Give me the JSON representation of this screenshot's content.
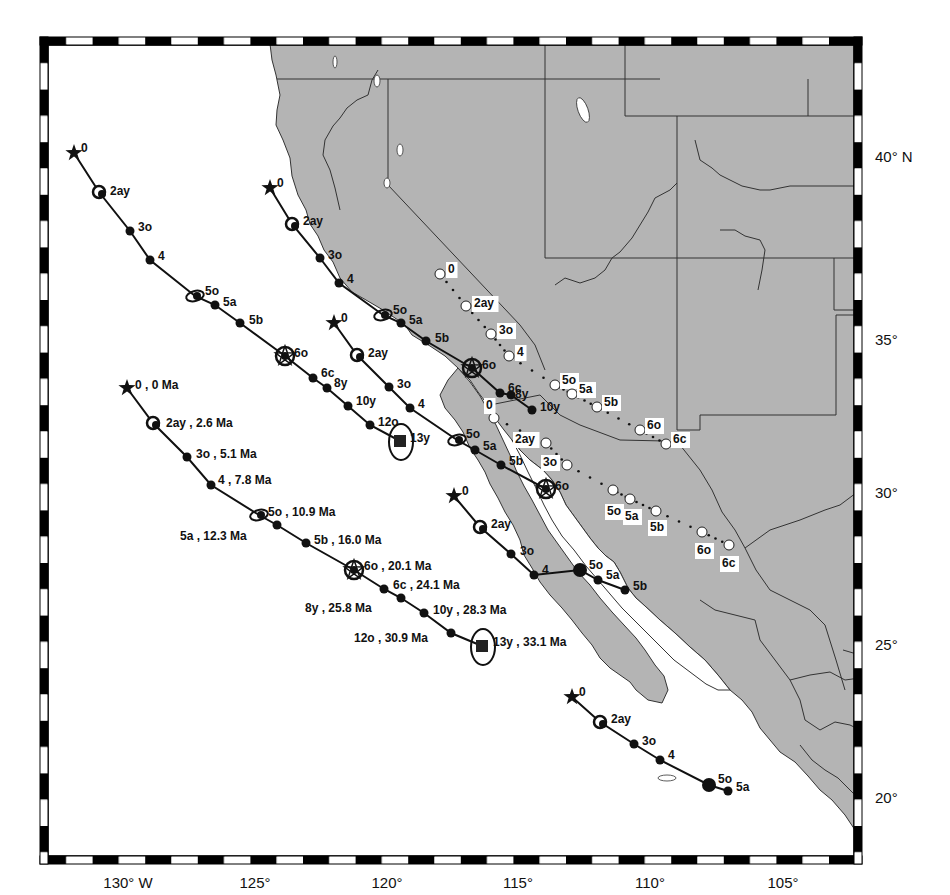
{
  "map": {
    "colors": {
      "land": "#b4b4b4",
      "ocean": "#ffffff",
      "border": "#333333",
      "frame": "#000000",
      "track": "#111111"
    },
    "lon_labels": [
      {
        "text": "130° W",
        "x": 128
      },
      {
        "text": "125°",
        "x": 255
      },
      {
        "text": "120°",
        "x": 387
      },
      {
        "text": "115°",
        "x": 518
      },
      {
        "text": "110°",
        "x": 650
      },
      {
        "text": "105°",
        "x": 783
      }
    ],
    "lat_labels": [
      {
        "text": "40° N",
        "y": 157
      },
      {
        "text": "35°",
        "y": 340
      },
      {
        "text": "30°",
        "y": 493
      },
      {
        "text": "25°",
        "y": 645
      },
      {
        "text": "20°",
        "y": 798
      }
    ],
    "tracks": [
      {
        "name": "track-far-west-annotated",
        "points": [
          {
            "label": "0 , 0 Ma",
            "x": 127,
            "y": 388,
            "sym": "star",
            "lx": 135,
            "ly": 386
          },
          {
            "label": "2ay , 2.6 Ma",
            "x": 153,
            "y": 423,
            "sym": "ring",
            "lx": 166,
            "ly": 424
          },
          {
            "label": "3o , 5.1 Ma",
            "x": 187,
            "y": 457,
            "sym": "dot",
            "lx": 196,
            "ly": 455
          },
          {
            "label": "4 , 7.8 Ma",
            "x": 211,
            "y": 485,
            "sym": "dot",
            "lx": 218,
            "ly": 481
          },
          {
            "label": "5o , 10.9 Ma",
            "x": 259,
            "y": 515,
            "sym": "ellipse",
            "lx": 268,
            "ly": 513
          },
          {
            "label": "5a , 12.3 Ma",
            "x": 277,
            "y": 525,
            "sym": "dot",
            "lx": 180,
            "ly": 537
          },
          {
            "label": "5b , 16.0 Ma",
            "x": 306,
            "y": 543,
            "sym": "dot",
            "lx": 314,
            "ly": 541
          },
          {
            "label": "6o , 20.1 Ma",
            "x": 354,
            "y": 570,
            "sym": "bigstar",
            "lx": 364,
            "ly": 567
          },
          {
            "label": "6c , 24.1 Ma",
            "x": 384,
            "y": 589,
            "sym": "dot",
            "lx": 393,
            "ly": 586
          },
          {
            "label": "8y , 25.8 Ma",
            "x": 401,
            "y": 598,
            "sym": "dot",
            "lx": 305,
            "ly": 609
          },
          {
            "label": "10y , 28.3 Ma",
            "x": 424,
            "y": 613,
            "sym": "dot",
            "lx": 433,
            "ly": 611
          },
          {
            "label": "12o , 30.9 Ma",
            "x": 451,
            "y": 633,
            "sym": "dot",
            "lx": 354,
            "ly": 639
          },
          {
            "label": "13y , 33.1 Ma",
            "x": 482,
            "y": 646,
            "sym": "square",
            "lx": 493,
            "ly": 643
          }
        ]
      },
      {
        "name": "track-far-west",
        "points": [
          {
            "label": "0",
            "x": 74,
            "y": 153,
            "sym": "star",
            "lx": 81,
            "ly": 149
          },
          {
            "label": "2ay",
            "x": 99,
            "y": 192,
            "sym": "ring",
            "lx": 110,
            "ly": 192
          },
          {
            "label": "3o",
            "x": 130,
            "y": 231,
            "sym": "dot",
            "lx": 138,
            "ly": 228
          },
          {
            "label": "4",
            "x": 150,
            "y": 260,
            "sym": "dot",
            "lx": 158,
            "ly": 257
          },
          {
            "label": "5o",
            "x": 195,
            "y": 296,
            "sym": "ellipse",
            "lx": 205,
            "ly": 292
          },
          {
            "label": "5a",
            "x": 215,
            "y": 305,
            "sym": "dot",
            "lx": 223,
            "ly": 303
          },
          {
            "label": "5b",
            "x": 240,
            "y": 323,
            "sym": "dot",
            "lx": 249,
            "ly": 321
          },
          {
            "label": "6o",
            "x": 285,
            "y": 356,
            "sym": "bigstar",
            "lx": 294,
            "ly": 354
          },
          {
            "label": "6c",
            "x": 313,
            "y": 378,
            "sym": "dot",
            "lx": 321,
            "ly": 374
          },
          {
            "label": "8y",
            "x": 327,
            "y": 388,
            "sym": "dot",
            "lx": 334,
            "ly": 384
          },
          {
            "label": "10y",
            "x": 348,
            "y": 406,
            "sym": "dot",
            "lx": 356,
            "ly": 402
          },
          {
            "label": "12o",
            "x": 370,
            "y": 425,
            "sym": "dot",
            "lx": 378,
            "ly": 423
          },
          {
            "label": "13y",
            "x": 400,
            "y": 441,
            "sym": "square",
            "lx": 410,
            "ly": 439
          }
        ]
      },
      {
        "name": "track-north-coast",
        "points": [
          {
            "label": "0",
            "x": 270,
            "y": 188,
            "sym": "star",
            "lx": 277,
            "ly": 184
          },
          {
            "label": "2ay",
            "x": 292,
            "y": 224,
            "sym": "ring",
            "lx": 303,
            "ly": 222
          },
          {
            "label": "3o",
            "x": 320,
            "y": 258,
            "sym": "dot",
            "lx": 328,
            "ly": 256
          },
          {
            "label": "4",
            "x": 339,
            "y": 283,
            "sym": "dot",
            "lx": 347,
            "ly": 280
          },
          {
            "label": "5o",
            "x": 383,
            "y": 315,
            "sym": "ellipse",
            "lx": 393,
            "ly": 311
          },
          {
            "label": "5a",
            "x": 401,
            "y": 323,
            "sym": "dot",
            "lx": 409,
            "ly": 321
          },
          {
            "label": "5b",
            "x": 426,
            "y": 341,
            "sym": "dot",
            "lx": 435,
            "ly": 339
          },
          {
            "label": "6o",
            "x": 472,
            "y": 368,
            "sym": "bigstar",
            "lx": 482,
            "ly": 366
          },
          {
            "label": "6c",
            "x": 500,
            "y": 393,
            "sym": "dot",
            "lx": 508,
            "ly": 389
          },
          {
            "label": "8y",
            "x": 511,
            "y": 395,
            "sym": "dot",
            "lx": 515,
            "ly": 395
          },
          {
            "label": "10y",
            "x": 532,
            "y": 410,
            "sym": "dot",
            "lx": 540,
            "ly": 408
          }
        ]
      },
      {
        "name": "track-central",
        "points": [
          {
            "label": "0",
            "x": 334,
            "y": 323,
            "sym": "star",
            "lx": 341,
            "ly": 319
          },
          {
            "label": "2ay",
            "x": 357,
            "y": 355,
            "sym": "ring",
            "lx": 368,
            "ly": 354
          },
          {
            "label": "3o",
            "x": 389,
            "y": 387,
            "sym": "dot",
            "lx": 397,
            "ly": 385
          },
          {
            "label": "4",
            "x": 410,
            "y": 408,
            "sym": "dot",
            "lx": 418,
            "ly": 405
          },
          {
            "label": "5o",
            "x": 457,
            "y": 440,
            "sym": "ellipse",
            "lx": 466,
            "ly": 435
          },
          {
            "label": "5a",
            "x": 475,
            "y": 450,
            "sym": "dot",
            "lx": 483,
            "ly": 447
          },
          {
            "label": "5b",
            "x": 501,
            "y": 465,
            "sym": "dot",
            "lx": 509,
            "ly": 462
          },
          {
            "label": "6o",
            "x": 546,
            "y": 489,
            "sym": "bigstar",
            "lx": 555,
            "ly": 487
          }
        ]
      },
      {
        "name": "track-baja",
        "points": [
          {
            "label": "0",
            "x": 454,
            "y": 496,
            "sym": "star",
            "lx": 462,
            "ly": 492
          },
          {
            "label": "2ay",
            "x": 480,
            "y": 527,
            "sym": "ring",
            "lx": 491,
            "ly": 525
          },
          {
            "label": "3o",
            "x": 511,
            "y": 554,
            "sym": "dot",
            "lx": 520,
            "ly": 552
          },
          {
            "label": "4",
            "x": 534,
            "y": 575,
            "sym": "dot",
            "lx": 542,
            "ly": 571
          },
          {
            "label": "5o",
            "x": 580,
            "y": 570,
            "sym": "bigdot",
            "lx": 589,
            "ly": 566
          },
          {
            "label": "5a",
            "x": 598,
            "y": 580,
            "sym": "dot",
            "lx": 606,
            "ly": 576
          },
          {
            "label": "5b",
            "x": 625,
            "y": 590,
            "sym": "dot",
            "lx": 633,
            "ly": 587
          }
        ]
      },
      {
        "name": "track-south",
        "points": [
          {
            "label": "0",
            "x": 572,
            "y": 697,
            "sym": "star",
            "lx": 579,
            "ly": 693
          },
          {
            "label": "2ay",
            "x": 600,
            "y": 722,
            "sym": "ring",
            "lx": 611,
            "ly": 720
          },
          {
            "label": "3o",
            "x": 634,
            "y": 744,
            "sym": "dot",
            "lx": 642,
            "ly": 742
          },
          {
            "label": "4",
            "x": 660,
            "y": 760,
            "sym": "dot",
            "lx": 668,
            "ly": 756
          },
          {
            "label": "5o",
            "x": 709,
            "y": 785,
            "sym": "bigdot",
            "lx": 718,
            "ly": 780
          },
          {
            "label": "5a",
            "x": 728,
            "y": 791,
            "sym": "dot",
            "lx": 736,
            "ly": 788
          }
        ]
      }
    ],
    "open_tracks": [
      {
        "name": "open-track-north",
        "points": [
          {
            "label": "0",
            "x": 440,
            "y": 274,
            "lx": 448,
            "ly": 270
          },
          {
            "label": "2ay",
            "x": 466,
            "y": 306,
            "lx": 474,
            "ly": 304
          },
          {
            "label": "3o",
            "x": 491,
            "y": 334,
            "lx": 499,
            "ly": 331
          },
          {
            "label": "4",
            "x": 509,
            "y": 356,
            "lx": 517,
            "ly": 353
          },
          {
            "label": "5o",
            "x": 555,
            "y": 385,
            "lx": 562,
            "ly": 381
          },
          {
            "label": "5a",
            "x": 572,
            "y": 394,
            "lx": 579,
            "ly": 390
          },
          {
            "label": "5b",
            "x": 597,
            "y": 407,
            "lx": 604,
            "ly": 403
          },
          {
            "label": "6o",
            "x": 640,
            "y": 430,
            "lx": 647,
            "ly": 426
          },
          {
            "label": "6c",
            "x": 666,
            "y": 444,
            "lx": 673,
            "ly": 440
          }
        ]
      },
      {
        "name": "open-track-south",
        "points": [
          {
            "label": "0",
            "x": 494,
            "y": 418,
            "lx": 486,
            "ly": 406
          },
          {
            "label": "2ay",
            "x": 546,
            "y": 443,
            "lx": 515,
            "ly": 440
          },
          {
            "label": "3o",
            "x": 567,
            "y": 465,
            "lx": 543,
            "ly": 463
          },
          {
            "label": "5o",
            "x": 613,
            "y": 490,
            "lx": 607,
            "ly": 512
          },
          {
            "label": "5a",
            "x": 630,
            "y": 499,
            "lx": 625,
            "ly": 517
          },
          {
            "label": "5b",
            "x": 656,
            "y": 511,
            "lx": 650,
            "ly": 528
          },
          {
            "label": "6o",
            "x": 702,
            "y": 532,
            "lx": 697,
            "ly": 551
          },
          {
            "label": "6c",
            "x": 729,
            "y": 545,
            "lx": 722,
            "ly": 564
          }
        ]
      }
    ]
  }
}
